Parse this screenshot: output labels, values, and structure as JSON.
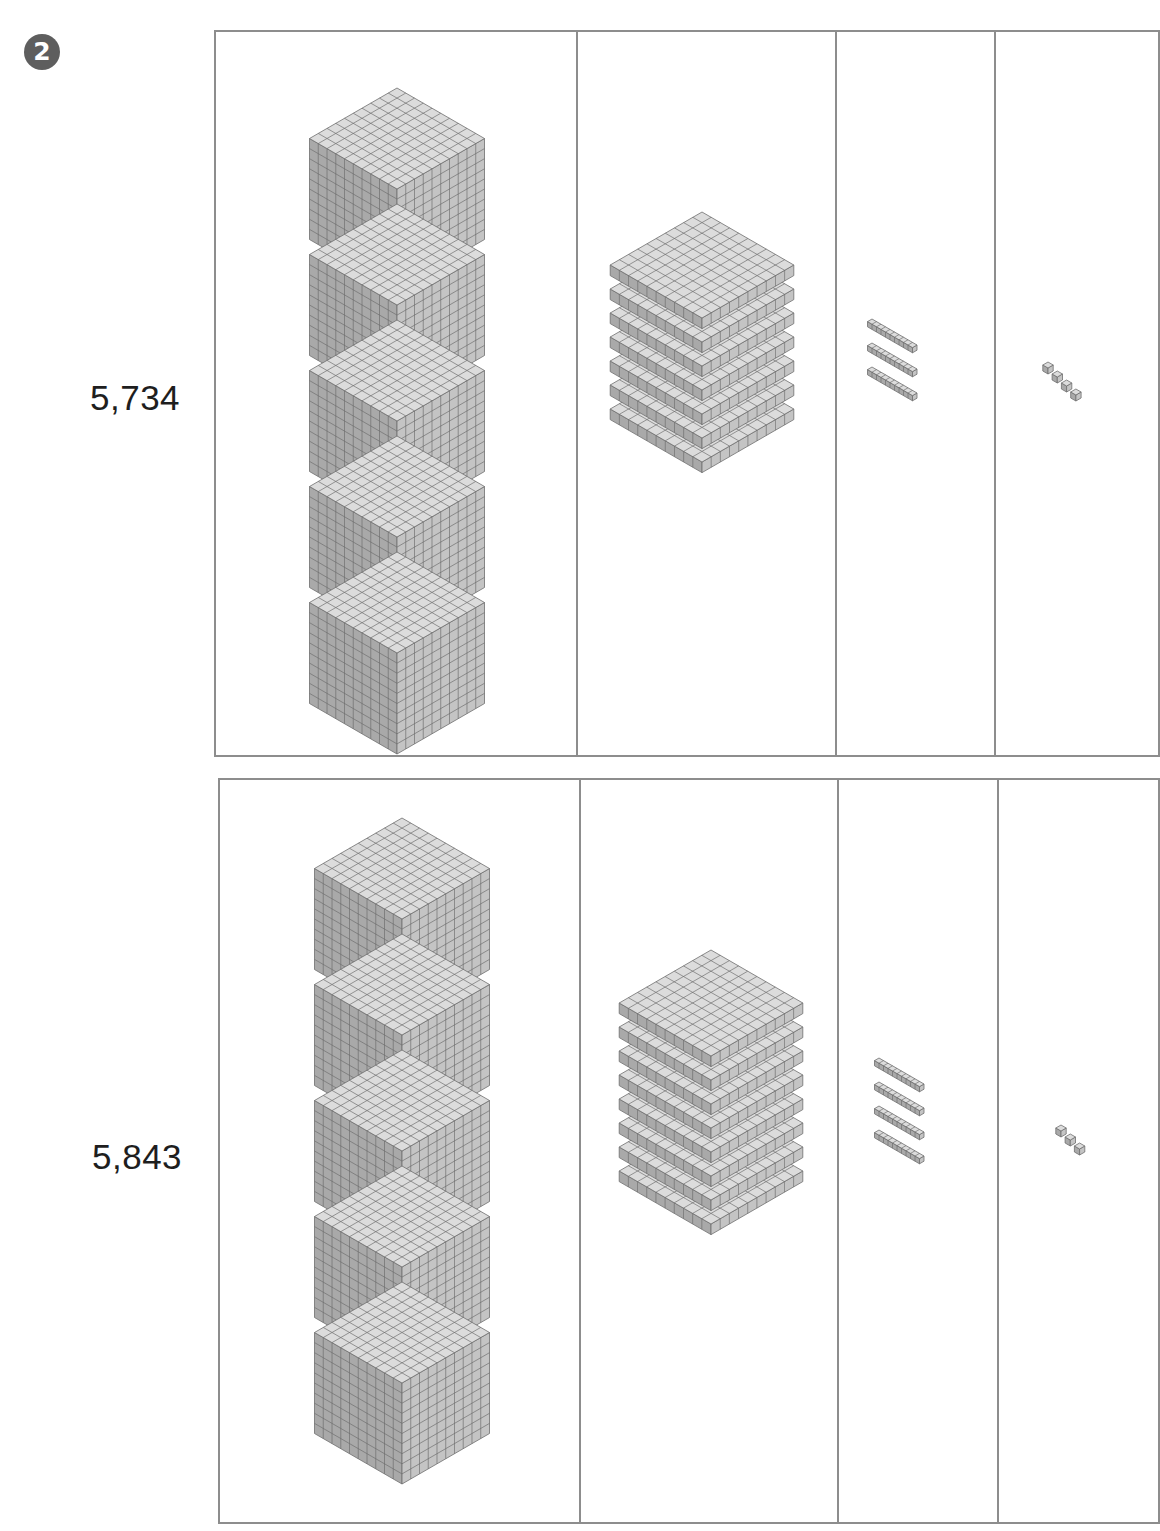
{
  "exercise": {
    "number": "2"
  },
  "columns": [
    "thousands",
    "hundreds",
    "tens",
    "ones"
  ],
  "rows": [
    {
      "label": "5,734",
      "blocks": {
        "thousands": 5,
        "hundreds": 7,
        "tens": 3,
        "ones": 4
      }
    },
    {
      "label": "5,843",
      "blocks": {
        "thousands": 5,
        "hundreds": 8,
        "tens": 4,
        "ones": 3
      }
    }
  ],
  "colors": {
    "border": "#8d8d8d",
    "cube_top": "#dcdcdc",
    "cube_left": "#a9a9a9",
    "cube_right": "#c4c4c4",
    "grid_line": "#6f6f6f",
    "badge": "#5e5e5e"
  }
}
